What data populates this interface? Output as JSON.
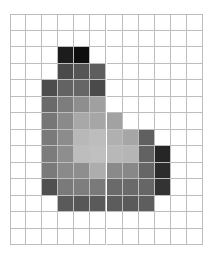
{
  "grid": {
    "cols": 12,
    "rows": 14,
    "background": "#ffffff",
    "line_color": "#bdbdbd",
    "filled_cells": [
      {
        "r": 2,
        "c": 3,
        "color": "#1c1c1c"
      },
      {
        "r": 2,
        "c": 4,
        "color": "#0e0e0e"
      },
      {
        "r": 3,
        "c": 3,
        "color": "#4a4a4a"
      },
      {
        "r": 3,
        "c": 4,
        "color": "#555555"
      },
      {
        "r": 3,
        "c": 5,
        "color": "#5e5e5e"
      },
      {
        "r": 4,
        "c": 2,
        "color": "#4d4d4d"
      },
      {
        "r": 4,
        "c": 3,
        "color": "#636363"
      },
      {
        "r": 4,
        "c": 4,
        "color": "#666666"
      },
      {
        "r": 4,
        "c": 5,
        "color": "#4a4a4a"
      },
      {
        "r": 5,
        "c": 2,
        "color": "#6a6a6a"
      },
      {
        "r": 5,
        "c": 3,
        "color": "#7d7d7d"
      },
      {
        "r": 5,
        "c": 4,
        "color": "#8e8e8e"
      },
      {
        "r": 5,
        "c": 5,
        "color": "#a0a0a0"
      },
      {
        "r": 6,
        "c": 2,
        "color": "#767676"
      },
      {
        "r": 6,
        "c": 3,
        "color": "#8a8a8a"
      },
      {
        "r": 6,
        "c": 4,
        "color": "#a8a8a8"
      },
      {
        "r": 6,
        "c": 5,
        "color": "#a6a6a6"
      },
      {
        "r": 6,
        "c": 6,
        "color": "#a2a2a2"
      },
      {
        "r": 7,
        "c": 2,
        "color": "#7a7a7a"
      },
      {
        "r": 7,
        "c": 3,
        "color": "#8c8c8c"
      },
      {
        "r": 7,
        "c": 4,
        "color": "#b8b8b8"
      },
      {
        "r": 7,
        "c": 5,
        "color": "#bdbdbd"
      },
      {
        "r": 7,
        "c": 6,
        "color": "#b0b0b0"
      },
      {
        "r": 7,
        "c": 7,
        "color": "#a6a6a6"
      },
      {
        "r": 7,
        "c": 8,
        "color": "#606060"
      },
      {
        "r": 8,
        "c": 2,
        "color": "#7c7c7c"
      },
      {
        "r": 8,
        "c": 3,
        "color": "#8e8e8e"
      },
      {
        "r": 8,
        "c": 4,
        "color": "#bdbdbd"
      },
      {
        "r": 8,
        "c": 5,
        "color": "#c0c0c0"
      },
      {
        "r": 8,
        "c": 6,
        "color": "#b8b8b8"
      },
      {
        "r": 8,
        "c": 7,
        "color": "#b5b5b5"
      },
      {
        "r": 8,
        "c": 8,
        "color": "#626262"
      },
      {
        "r": 8,
        "c": 9,
        "color": "#262626"
      },
      {
        "r": 9,
        "c": 2,
        "color": "#7a7a7a"
      },
      {
        "r": 9,
        "c": 3,
        "color": "#8a8a8a"
      },
      {
        "r": 9,
        "c": 4,
        "color": "#8e8e8e"
      },
      {
        "r": 9,
        "c": 5,
        "color": "#adadad"
      },
      {
        "r": 9,
        "c": 6,
        "color": "#8a8a8a"
      },
      {
        "r": 9,
        "c": 7,
        "color": "#888888"
      },
      {
        "r": 9,
        "c": 8,
        "color": "#666666"
      },
      {
        "r": 9,
        "c": 9,
        "color": "#2c2c2c"
      },
      {
        "r": 10,
        "c": 2,
        "color": "#505050"
      },
      {
        "r": 10,
        "c": 3,
        "color": "#7a7a7a"
      },
      {
        "r": 10,
        "c": 4,
        "color": "#7e7e7e"
      },
      {
        "r": 10,
        "c": 5,
        "color": "#7a7a7a"
      },
      {
        "r": 10,
        "c": 6,
        "color": "#6a6a6a"
      },
      {
        "r": 10,
        "c": 7,
        "color": "#6a6a6a"
      },
      {
        "r": 10,
        "c": 8,
        "color": "#666666"
      },
      {
        "r": 10,
        "c": 9,
        "color": "#333333"
      },
      {
        "r": 11,
        "c": 3,
        "color": "#5a5a5a"
      },
      {
        "r": 11,
        "c": 4,
        "color": "#575757"
      },
      {
        "r": 11,
        "c": 5,
        "color": "#5a5a5a"
      },
      {
        "r": 11,
        "c": 6,
        "color": "#5c5c5c"
      },
      {
        "r": 11,
        "c": 7,
        "color": "#5a5a5a"
      },
      {
        "r": 11,
        "c": 8,
        "color": "#5e5e5e"
      }
    ]
  }
}
